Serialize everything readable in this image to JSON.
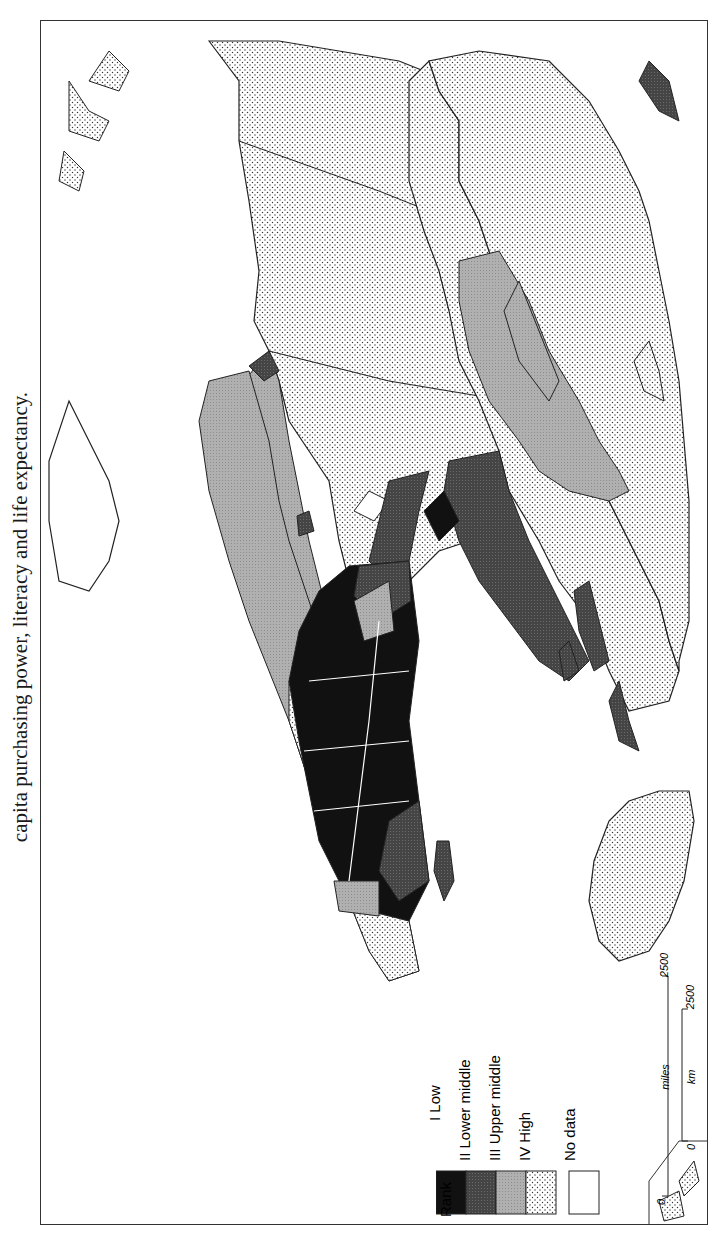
{
  "caption": {
    "text": "capita purchasing power, literacy and life expectancy."
  },
  "map": {
    "title": "World development ranking map",
    "orientation": "rotated 90° clockwise (north to the left)",
    "colors": {
      "low": "#111111",
      "lower_middle": "#4a4a4a",
      "upper_middle": "#a8a8a8",
      "high": "#f2f2f2",
      "no_data": "#ffffff",
      "outline": "#222222"
    },
    "regions": [
      {
        "name": "North America (USA/Canada)",
        "rank": "IV High"
      },
      {
        "name": "Greenland",
        "rank": "No data"
      },
      {
        "name": "Mexico",
        "rank": "III Upper middle"
      },
      {
        "name": "Central America",
        "rank": "II Lower middle"
      },
      {
        "name": "Brazil",
        "rank": "III Upper middle"
      },
      {
        "name": "Bolivia",
        "rank": "II Lower middle"
      },
      {
        "name": "Argentina/Chile",
        "rank": "IV High"
      },
      {
        "name": "Europe",
        "rank": "IV High"
      },
      {
        "name": "USSR",
        "rank": "IV High"
      },
      {
        "name": "China",
        "rank": "III Upper middle"
      },
      {
        "name": "Mongolia",
        "rank": "III Upper middle"
      },
      {
        "name": "South Asia",
        "rank": "II Lower middle"
      },
      {
        "name": "Middle East",
        "rank": "II Lower middle"
      },
      {
        "name": "North Africa",
        "rank": "II Lower middle"
      },
      {
        "name": "Libya",
        "rank": "III Upper middle"
      },
      {
        "name": "Sub-Saharan Africa",
        "rank": "I Low"
      },
      {
        "name": "South Africa",
        "rank": "III Upper middle"
      },
      {
        "name": "Madagascar",
        "rank": "II Lower middle"
      },
      {
        "name": "Southeast Asia",
        "rank": "II Lower middle"
      },
      {
        "name": "Japan",
        "rank": "IV High"
      },
      {
        "name": "Australia",
        "rank": "IV High"
      },
      {
        "name": "New Zealand",
        "rank": "IV High"
      }
    ]
  },
  "legend": {
    "title": "Rank",
    "items": [
      {
        "numeral": "I",
        "label": "I Low",
        "key": "low"
      },
      {
        "numeral": "II",
        "label": "II Lower middle",
        "key": "lower_middle"
      },
      {
        "numeral": "III",
        "label": "III Upper middle",
        "key": "upper_middle"
      },
      {
        "numeral": "IV",
        "label": "IV High",
        "key": "high"
      }
    ],
    "no_data_label": "No data"
  },
  "scale_bar": {
    "miles_label": "miles",
    "km_label": "km",
    "miles_start": "0",
    "miles_end": "2500",
    "km_start": "0",
    "km_end": "2500"
  }
}
